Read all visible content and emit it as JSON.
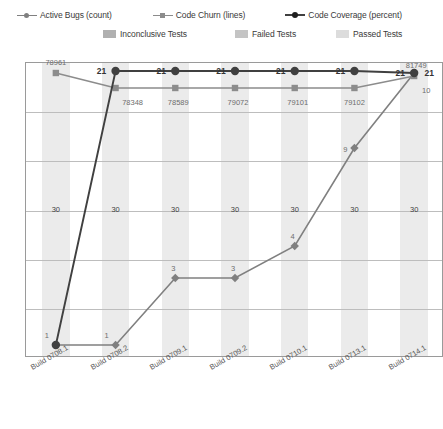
{
  "legend": {
    "row1": [
      {
        "name": "active-bugs",
        "label": "Active Bugs (count)",
        "color": "#808080",
        "marker": "dot"
      },
      {
        "name": "code-churn",
        "label": "Code Churn (lines)",
        "color": "#8c8c8c",
        "marker": "square"
      },
      {
        "name": "code-coverage",
        "label": "Code Coverage (percent)",
        "color": "#404040",
        "marker": "dot"
      }
    ],
    "row2": [
      {
        "name": "inconclusive-tests",
        "label": "Inconclusive Tests",
        "color": "#b0b0b0"
      },
      {
        "name": "failed-tests",
        "label": "Failed Tests",
        "color": "#c4c4c4"
      },
      {
        "name": "passed-tests",
        "label": "Passed Tests",
        "color": "#dcdcdc"
      }
    ]
  },
  "chart_data": {
    "type": "line",
    "title": "",
    "xlabel": "",
    "ylabel": "",
    "grid": true,
    "legend_position": "top",
    "categories": [
      "Build 0708.1",
      "Build 0708.2",
      "Build 0709.1",
      "Build 0709.2",
      "Build 0710.1",
      "Build 0713.1",
      "Build 0714.1"
    ],
    "series": [
      {
        "name": "Active Bugs (count)",
        "color": "#808080",
        "marker": "diamond",
        "values": [
          1,
          1,
          3,
          3,
          4,
          9,
          21
        ],
        "labels": [
          "1",
          "1",
          "3",
          "3",
          "4",
          "9",
          "21"
        ]
      },
      {
        "name": "Code Churn (lines)",
        "color": "#8c8c8c",
        "marker": "square",
        "values": [
          78961,
          78348,
          78589,
          79072,
          79101,
          79102,
          81749
        ],
        "labels": [
          "78961",
          "78348",
          "78589",
          "79072",
          "79101",
          "79102",
          "81749"
        ]
      },
      {
        "name": "Code Coverage (percent)",
        "color": "#404040",
        "marker": "circle",
        "values": [
          30,
          21,
          21,
          21,
          21,
          21,
          21
        ],
        "labels": [
          "21",
          "21",
          "21",
          "21",
          "21",
          "21",
          "21"
        ]
      }
    ],
    "column_labels": [
      "30",
      "30",
      "30",
      "30",
      "30",
      "30",
      "30"
    ],
    "extra_labels": [
      "10"
    ]
  }
}
